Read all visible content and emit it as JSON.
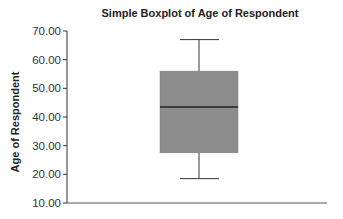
{
  "chart_data": {
    "type": "boxplot",
    "title": "Simple Boxplot of Age of Respondent",
    "xlabel": "",
    "ylabel": "Age of Respondent",
    "ylim": [
      10,
      70
    ],
    "yticks": [
      "10.00",
      "20.00",
      "30.00",
      "40.00",
      "50.00",
      "60.00",
      "70.00"
    ],
    "grid": false,
    "legend": null,
    "series": [
      {
        "name": "Age of Respondent",
        "whisker_low": 18.5,
        "q1": 27.5,
        "median": 43.5,
        "q3": 56,
        "whisker_high": 67
      }
    ],
    "colors": {
      "box_fill": "#8c8c8c",
      "lines": "#333333"
    }
  }
}
